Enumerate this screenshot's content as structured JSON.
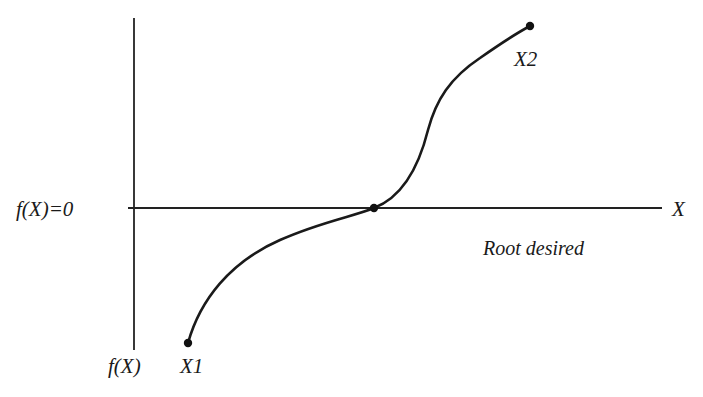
{
  "figure": {
    "type": "function root-finding sketch",
    "top_fragment_text": "",
    "axes": {
      "horizontal_axis_label": "X",
      "horizontal_axis_left_label": "f(X)=0",
      "vertical_axis_label": "f(X)"
    },
    "points": [
      {
        "id": "x1",
        "label": "X1",
        "x": 188,
        "y": 343
      },
      {
        "id": "root",
        "label": "",
        "x": 374,
        "y": 208
      },
      {
        "id": "x2",
        "label": "X2",
        "x": 530,
        "y": 26
      }
    ],
    "annotation": "Root desired",
    "colors": {
      "line": "#1a1a1a",
      "background": "#ffffff"
    }
  }
}
